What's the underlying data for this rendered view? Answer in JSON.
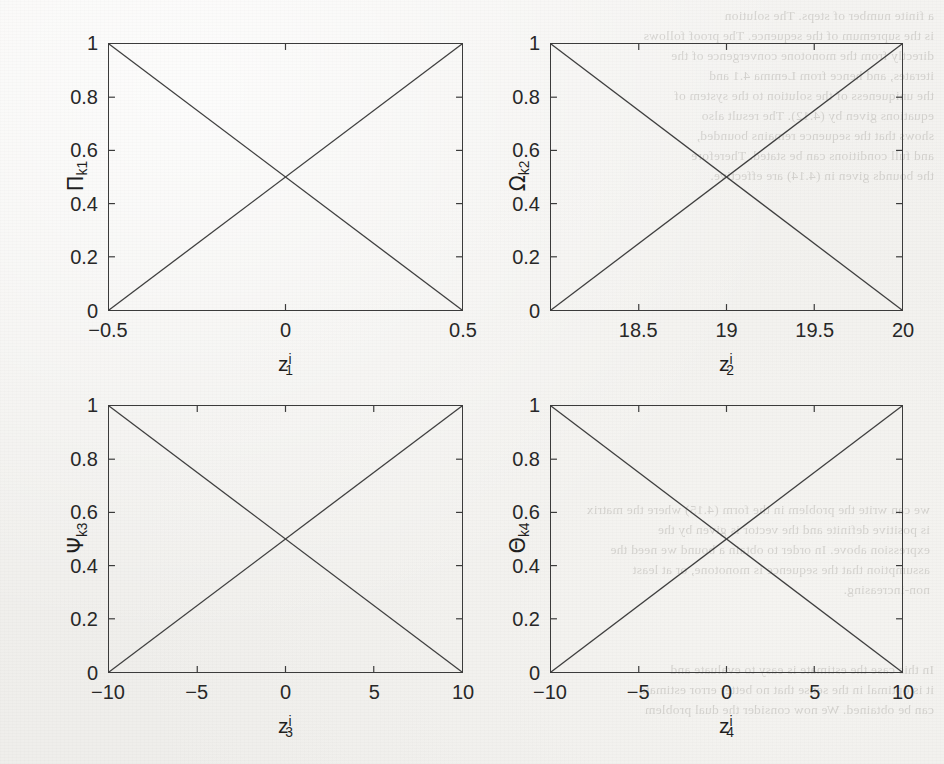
{
  "document": {
    "kind": "scanned-journal-figure",
    "background_color": "#f1f0ed",
    "ink_color": "#2a2a2a"
  },
  "ghost_text": {
    "top_right": "a finite number of steps. The solution\nis the supremum of the sequence. The proof follows\ndirectly from the monotone convergence of the\niterates, and hence from Lemma 4.1 and\nthe uniqueness of the solution to the system of\nequations given by (4.12). The result also\nshows that the sequence remains bounded,\nand full conditions can be stated. Therefore\nthe bounds given in (4.14) are effective.",
    "middle_right": "we can write the problem in the form (4.15) where the matrix\nis positive definite and the vector is given by the\nexpression above. In order to obtain a bound we need the\nassumption that the sequence is monotone, or at least\nnon-increasing.",
    "bottom_right": "In this case the estimate is easy to evaluate and\nit is optimal in the sense that no better error estimate\ncan be obtained. We now consider the dual problem"
  },
  "chart_data": [
    {
      "id": "panel-1",
      "type": "line",
      "title": "",
      "xlabel": "z_1^i",
      "xlabel_base": "z",
      "xlabel_sub": "1",
      "xlabel_sup": "i",
      "ylabel": "Π_k1",
      "ylabel_base": "Π",
      "ylabel_sub": "k1",
      "xlim": [
        -0.5,
        0.5
      ],
      "ylim": [
        0,
        1
      ],
      "xticks": [
        -0.5,
        0,
        0.5
      ],
      "xticklabels": [
        "-0.5",
        "0",
        "0.5"
      ],
      "yticks": [
        0,
        0.2,
        0.4,
        0.6,
        0.8,
        1
      ],
      "yticklabels": [
        "0",
        "0.2",
        "0.4",
        "0.6",
        "0.8",
        "1"
      ],
      "grid": false,
      "legend": "none",
      "series": [
        {
          "name": "descending",
          "x": [
            -0.5,
            0.5
          ],
          "y": [
            1,
            0
          ]
        },
        {
          "name": "ascending",
          "x": [
            -0.5,
            0.5
          ],
          "y": [
            0,
            1
          ]
        }
      ]
    },
    {
      "id": "panel-2",
      "type": "line",
      "title": "",
      "xlabel": "z_2^i",
      "xlabel_base": "z",
      "xlabel_sub": "2",
      "xlabel_sup": "i",
      "ylabel": "Ω_k2",
      "ylabel_base": "Ω",
      "ylabel_sub": "k2",
      "xlim": [
        18,
        20
      ],
      "ylim": [
        0,
        1
      ],
      "xticks": [
        18.5,
        19,
        19.5,
        20
      ],
      "xticklabels": [
        "18.5",
        "19",
        "19.5",
        "20"
      ],
      "yticks": [
        0,
        0.2,
        0.4,
        0.6,
        0.8,
        1
      ],
      "yticklabels": [
        "0",
        "0.2",
        "0.4",
        "0.6",
        "0.8",
        "1"
      ],
      "grid": false,
      "legend": "none",
      "series": [
        {
          "name": "descending",
          "x": [
            18,
            20
          ],
          "y": [
            1,
            0
          ]
        },
        {
          "name": "ascending",
          "x": [
            18,
            20
          ],
          "y": [
            0,
            1
          ]
        }
      ]
    },
    {
      "id": "panel-3",
      "type": "line",
      "title": "",
      "xlabel": "z_3^i",
      "xlabel_base": "z",
      "xlabel_sub": "3",
      "xlabel_sup": "i",
      "ylabel": "Ψ_k3",
      "ylabel_base": "Ψ",
      "ylabel_sub": "k3",
      "xlim": [
        -10,
        10
      ],
      "ylim": [
        0,
        1
      ],
      "xticks": [
        -10,
        -5,
        0,
        5,
        10
      ],
      "xticklabels": [
        "-10",
        "-5",
        "0",
        "5",
        "10"
      ],
      "yticks": [
        0,
        0.2,
        0.4,
        0.6,
        0.8,
        1
      ],
      "yticklabels": [
        "0",
        "0.2",
        "0.4",
        "0.6",
        "0.8",
        "1"
      ],
      "grid": false,
      "legend": "none",
      "series": [
        {
          "name": "descending",
          "x": [
            -10,
            10
          ],
          "y": [
            1,
            0
          ]
        },
        {
          "name": "ascending",
          "x": [
            -10,
            10
          ],
          "y": [
            0,
            1
          ]
        }
      ]
    },
    {
      "id": "panel-4",
      "type": "line",
      "title": "",
      "xlabel": "z_4^i",
      "xlabel_base": "z",
      "xlabel_sub": "4",
      "xlabel_sup": "i",
      "ylabel": "Θ_k4",
      "ylabel_base": "Θ",
      "ylabel_sub": "k4",
      "xlim": [
        -10,
        10
      ],
      "ylim": [
        0,
        1
      ],
      "xticks": [
        -10,
        -5,
        0,
        5,
        10
      ],
      "xticklabels": [
        "-10",
        "-5",
        "0",
        "5",
        "10"
      ],
      "yticks": [
        0,
        0.2,
        0.4,
        0.6,
        0.8,
        1
      ],
      "yticklabels": [
        "0",
        "0.2",
        "0.4",
        "0.6",
        "0.8",
        "1"
      ],
      "grid": false,
      "legend": "none",
      "series": [
        {
          "name": "descending",
          "x": [
            -10,
            10
          ],
          "y": [
            1,
            0
          ]
        },
        {
          "name": "ascending",
          "x": [
            -10,
            10
          ],
          "y": [
            0,
            1
          ]
        }
      ]
    }
  ],
  "panel_geometry": [
    {
      "id": "panel-1",
      "left": 108,
      "top": 43,
      "width": 355,
      "height": 268
    },
    {
      "id": "panel-2",
      "left": 550,
      "top": 43,
      "width": 353,
      "height": 268
    },
    {
      "id": "panel-3",
      "left": 108,
      "top": 405,
      "width": 355,
      "height": 268
    },
    {
      "id": "panel-4",
      "left": 550,
      "top": 405,
      "width": 353,
      "height": 268
    }
  ]
}
